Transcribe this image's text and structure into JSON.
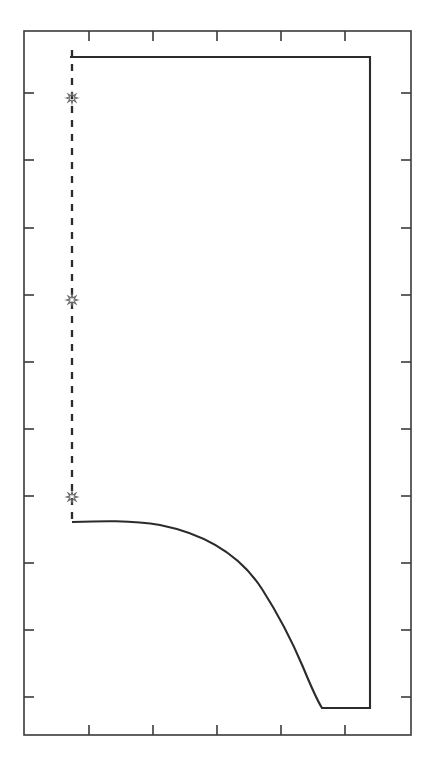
{
  "figure": {
    "width": 432,
    "height": 764,
    "background_color": "#ffffff",
    "title": "",
    "subtitle": ""
  },
  "axes": {
    "frame": {
      "left": 24,
      "top": 31,
      "right": 411,
      "bottom": 735
    },
    "frame_color": "#3a3a3a",
    "frame_linewidth": 1.6,
    "tick_color": "#3a3a3a",
    "tick_linewidth": 1.6,
    "tick_length": 10,
    "ticks_direction": "in",
    "x_tick_positions_px": [
      89,
      153,
      217,
      281,
      345
    ],
    "y_tick_positions_px": [
      93,
      160,
      228,
      295,
      362,
      429,
      496,
      563,
      630,
      697
    ],
    "x_tick_labels": [],
    "y_tick_labels": [],
    "grid": false,
    "xlabel": "",
    "ylabel": ""
  },
  "series": {
    "step_curve": {
      "name": "step-curve",
      "color": "#2b2b2b",
      "linewidth": 2.1,
      "linestyle": "solid",
      "points_px": [
        [
          70,
          57
        ],
        [
          370,
          57
        ],
        [
          370,
          708
        ],
        [
          322,
          708
        ],
        [
          317,
          700
        ],
        [
          311,
          686
        ],
        [
          305,
          671
        ],
        [
          298,
          654
        ],
        [
          290,
          635
        ],
        [
          282,
          616
        ],
        [
          273,
          597
        ],
        [
          263,
          578
        ],
        [
          252,
          560
        ],
        [
          240,
          344
        ],
        [
          0,
          0
        ]
      ],
      "path_d": "M 70 57 L 370 57 L 370 708 L 322 708 C 317 700 310 684 303 667 C 292 641 278 614 262 589 C 240 555 205 534 160 525 C 132 520 100 521 72 522",
      "description": "Closed solid boundary: horizontal top edge, right vertical edge, short flat bottom segment, then a concave decaying curve back to the left axis."
    },
    "threshold_line": {
      "name": "threshold-dashed-line",
      "color": "#2b2b2b",
      "linewidth": 2.3,
      "linestyle": "dashed",
      "dash_pattern": "7 7",
      "x_px": 72,
      "y_start_px": 50,
      "y_end_px": 523,
      "description": "Vertical dashed line at the left boundary of the region."
    }
  },
  "markers": {
    "symbol": "star",
    "name": "star-marker",
    "color": "#6a6a6a",
    "size_px": 11,
    "points_px": [
      {
        "x": 72,
        "y": 98
      },
      {
        "x": 72,
        "y": 300
      },
      {
        "x": 72,
        "y": 497
      }
    ]
  },
  "chart_data": {
    "type": "line",
    "title": "",
    "subtitle": "",
    "xlabel": "",
    "ylabel": "",
    "grid": false,
    "legend": null,
    "legend_position": "none",
    "axis_note": "Axes are unlabeled; ticks appear on all four sides pointing inward.",
    "xlim": [
      0,
      6
    ],
    "ylim": [
      0,
      11
    ],
    "x_ticks": [
      1,
      2,
      3,
      4,
      5
    ],
    "y_ticks": [
      1,
      2,
      3,
      4,
      5,
      6,
      7,
      8,
      9,
      10
    ],
    "x_tick_labels": [],
    "y_tick_labels": [],
    "series": [
      {
        "name": "boundary-curve",
        "style": "solid",
        "color": "#2b2b2b",
        "x": [
          0.72,
          4.87,
          4.87,
          4.12,
          4.04,
          3.92,
          3.76,
          3.56,
          3.32,
          3.04,
          2.72,
          2.32,
          1.8,
          1.22,
          0.74
        ],
        "y": [
          10.58,
          10.58,
          0.42,
          0.42,
          0.54,
          0.78,
          1.1,
          1.5,
          1.96,
          2.46,
          2.96,
          3.4,
          3.7,
          3.83,
          3.86
        ],
        "comment": "Traces the top horizontal segment, right vertical drop, flat bottom segment, then the concave decay back to the dashed line."
      },
      {
        "name": "threshold-dashed",
        "style": "dashed",
        "color": "#2b2b2b",
        "x": [
          0.74,
          0.74
        ],
        "y": [
          10.68,
          3.86
        ],
        "comment": "Vertical dashed line closing the region on the left."
      }
    ],
    "marker_series": {
      "name": "star-markers",
      "symbol": "star",
      "color": "#6a6a6a",
      "x": [
        0.74,
        0.74,
        0.74
      ],
      "y": [
        9.98,
        7.08,
        4.26
      ]
    },
    "annotations": []
  }
}
